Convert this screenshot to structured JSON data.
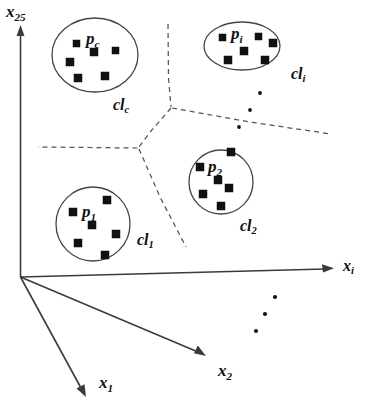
{
  "figure": {
    "background_color": "#ffffff",
    "line_color": "#3b3b3b",
    "point_color": "#111111",
    "boundary_color": "#555555"
  },
  "axes": [
    {
      "id": "x25",
      "base": "x",
      "sub": "25",
      "orientation": "vertical-up"
    },
    {
      "id": "xi",
      "base": "x",
      "sub": "i",
      "orientation": "horizontal-right"
    },
    {
      "id": "x2",
      "base": "x",
      "sub": "2",
      "orientation": "diagonal-down-right"
    },
    {
      "id": "x1",
      "base": "x",
      "sub": "1",
      "orientation": "diagonal-down-left"
    }
  ],
  "clusters": [
    {
      "id": "cl_c",
      "shape": "ellipse",
      "point_label": {
        "base": "p",
        "sub": "c"
      },
      "cluster_label": {
        "base": "cl",
        "sub": "c"
      },
      "point_count": 6
    },
    {
      "id": "cl_i",
      "shape": "ellipse",
      "point_label": {
        "base": "p",
        "sub": "i"
      },
      "cluster_label": {
        "base": "cl",
        "sub": "i"
      },
      "point_count": 6
    },
    {
      "id": "cl_2",
      "shape": "circle",
      "point_label": {
        "base": "p",
        "sub": "2"
      },
      "cluster_label": {
        "base": "cl",
        "sub": "2"
      },
      "point_count": 6
    },
    {
      "id": "cl_1",
      "shape": "circle",
      "point_label": {
        "base": "p",
        "sub": "1"
      },
      "cluster_label": {
        "base": "cl",
        "sub": "1"
      },
      "point_count": 6
    }
  ],
  "ellipsis_groups": [
    {
      "id": "ellipsis-clusters",
      "dot_count": 3,
      "direction": "diagonal-down-left"
    },
    {
      "id": "ellipsis-axes",
      "dot_count": 3,
      "direction": "diagonal-down-left"
    }
  ],
  "labels": {
    "y_axis": {
      "base": "x",
      "sub": "25"
    },
    "x_axis": {
      "base": "x",
      "sub": "i"
    },
    "x2_axis": {
      "base": "x",
      "sub": "2"
    },
    "x1_axis": {
      "base": "x",
      "sub": "1"
    },
    "cluster_c": {
      "base": "cl",
      "sub": "c"
    },
    "cluster_i": {
      "base": "cl",
      "sub": "i"
    },
    "cluster_2": {
      "base": "cl",
      "sub": "2"
    },
    "cluster_1": {
      "base": "cl",
      "sub": "1"
    },
    "point_c": {
      "base": "p",
      "sub": "c"
    },
    "point_i": {
      "base": "p",
      "sub": "i"
    },
    "point_2": {
      "base": "p",
      "sub": "2"
    },
    "point_1": {
      "base": "p",
      "sub": "1"
    }
  }
}
